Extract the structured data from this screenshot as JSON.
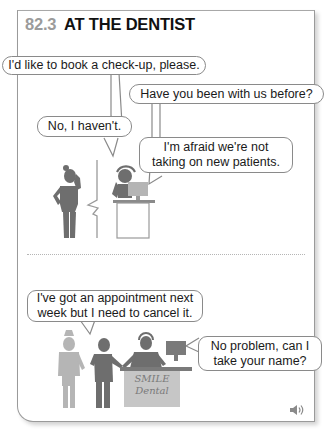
{
  "header": {
    "section_number": "82.3",
    "title": "AT THE DENTIST"
  },
  "scene_1": {
    "bubbles": [
      {
        "speaker": "patient",
        "text": "I'd like to book a check-up, please."
      },
      {
        "speaker": "receptionist",
        "text": "Have you been with us before?"
      },
      {
        "speaker": "patient",
        "text": "No, I haven't."
      },
      {
        "speaker": "receptionist",
        "lines": [
          "I'm afraid we're not",
          "taking on new patients."
        ]
      }
    ],
    "illustration": "woman-on-phone-and-receptionist-with-headset"
  },
  "scene_2": {
    "bubbles": [
      {
        "speaker": "patient",
        "lines": [
          "I've got an appointment next",
          "week but I need to cancel it."
        ]
      },
      {
        "speaker": "receptionist",
        "lines": [
          "No problem, can I",
          "take your name?"
        ]
      }
    ],
    "sign": {
      "line1": "SMILE",
      "line2": "Dental"
    },
    "illustration": "patients-at-dental-reception-desk"
  },
  "controls": {
    "audio_icon": "speaker-sound-icon"
  },
  "colors": {
    "section_number": "#9b9b9b",
    "figure_dark": "#6e6e6e",
    "figure_light": "#b0b0b0",
    "sign_fill": "#c6c6c6",
    "border": "#9a9a9a"
  }
}
